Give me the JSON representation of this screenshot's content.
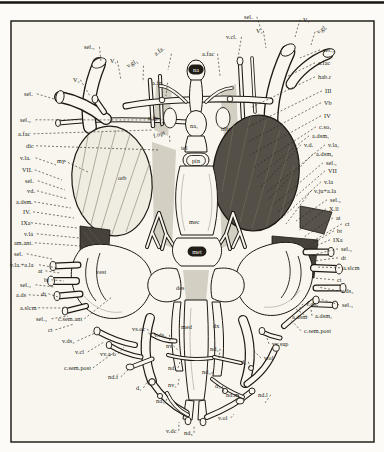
{
  "figure": {
    "kind": "anatomical-plate",
    "colors": {
      "ink": "#1d1812",
      "paper": "#f8f6ef",
      "orbit_dark": "#544f47",
      "block_dark": "#46413a"
    },
    "labels": [
      {
        "t": "sel.₁",
        "x": 84,
        "y": 49,
        "lx": 101,
        "ly": 62
      },
      {
        "t": "V₂",
        "x": 73,
        "y": 82,
        "lx": 90,
        "ly": 96
      },
      {
        "t": "sel.",
        "x": 24,
        "y": 96,
        "lx": 54,
        "ly": 99
      },
      {
        "t": "sel.₂",
        "x": 20,
        "y": 122,
        "lx": 164,
        "ly": 120
      },
      {
        "t": "a.fac",
        "x": 18,
        "y": 136,
        "lx": 152,
        "ly": 130
      },
      {
        "t": "dic",
        "x": 26,
        "y": 148,
        "lx": 158,
        "ly": 150
      },
      {
        "t": "v.la.",
        "x": 20,
        "y": 160,
        "lx": 56,
        "ly": 165
      },
      {
        "t": "my",
        "x": 57,
        "y": 163,
        "lx": 88,
        "ly": 172
      },
      {
        "t": "VII.",
        "x": 22,
        "y": 172,
        "lx": 62,
        "ly": 180
      },
      {
        "t": "sel.",
        "x": 25,
        "y": 183,
        "lx": 65,
        "ly": 190
      },
      {
        "t": "vd.",
        "x": 27,
        "y": 193,
        "lx": 68,
        "ly": 199
      },
      {
        "t": "a.dsm.",
        "x": 16,
        "y": 204,
        "lx": 71,
        "ly": 208
      },
      {
        "t": "IV.",
        "x": 23,
        "y": 214,
        "lx": 74,
        "ly": 218
      },
      {
        "t": "IXa",
        "x": 21,
        "y": 225,
        "lx": 77,
        "ly": 228
      },
      {
        "t": "v.la",
        "x": 24,
        "y": 236,
        "lx": 79,
        "ly": 238
      },
      {
        "t": "am.ant.",
        "x": 14,
        "y": 245,
        "lx": 81,
        "ly": 246
      },
      {
        "t": "sel.",
        "x": 14,
        "y": 256,
        "lx": 52,
        "ly": 259
      },
      {
        "t": "v.la.+a.la",
        "x": 10,
        "y": 267,
        "lx": 58,
        "ly": 268
      },
      {
        "t": "at",
        "x": 38,
        "y": 273,
        "lx": 60,
        "ly": 273
      },
      {
        "t": "bt",
        "x": 44,
        "y": 282,
        "lx": 64,
        "ly": 281
      },
      {
        "t": "sel.₃",
        "x": 20,
        "y": 287,
        "lx": 54,
        "ly": 287
      },
      {
        "t": "a.ds",
        "x": 16,
        "y": 297,
        "lx": 48,
        "ly": 296
      },
      {
        "t": "dt",
        "x": 41,
        "y": 296,
        "lx": 58,
        "ly": 297
      },
      {
        "t": "a.slcm",
        "x": 20,
        "y": 310,
        "lx": 64,
        "ly": 308
      },
      {
        "t": "sel.₄",
        "x": 36,
        "y": 321,
        "lx": 68,
        "ly": 316
      },
      {
        "t": "c.sem.ant",
        "x": 58,
        "y": 321,
        "lx": 112,
        "ly": 297
      },
      {
        "t": "ct",
        "x": 48,
        "y": 332,
        "lx": 74,
        "ly": 324
      },
      {
        "t": "v.ds₄",
        "x": 62,
        "y": 343,
        "lx": 95,
        "ly": 333
      },
      {
        "t": "v.cl",
        "x": 75,
        "y": 354,
        "lx": 104,
        "ly": 342
      },
      {
        "t": "c.sem.post",
        "x": 64,
        "y": 370,
        "lx": 116,
        "ly": 351
      },
      {
        "t": "vv.a-o",
        "x": 100,
        "y": 356,
        "lx": 124,
        "ly": 347
      },
      {
        "t": "nd.f",
        "x": 108,
        "y": 379,
        "lx": 128,
        "ly": 370
      },
      {
        "t": "d₁",
        "x": 136,
        "y": 390,
        "lx": 148,
        "ly": 381
      },
      {
        "t": "nd₄",
        "x": 156,
        "y": 403,
        "lx": 168,
        "ly": 395
      },
      {
        "t": "v.dc",
        "x": 166,
        "y": 433,
        "lx": 179,
        "ly": 422
      },
      {
        "t": "nd₅",
        "x": 184,
        "y": 435,
        "lx": 194,
        "ly": 425
      },
      {
        "t": "nv₁",
        "x": 168,
        "y": 387,
        "lx": 179,
        "ly": 379
      },
      {
        "t": "nd₁",
        "x": 168,
        "y": 370,
        "lx": 180,
        "ly": 362
      },
      {
        "t": "nv",
        "x": 166,
        "y": 348,
        "lx": 179,
        "ly": 351
      },
      {
        "t": "v.ds₅",
        "x": 154,
        "y": 337,
        "lx": 170,
        "ly": 342
      },
      {
        "t": "vs.oc",
        "x": 132,
        "y": 331,
        "lx": 150,
        "ly": 336
      },
      {
        "t": "med",
        "x": 181,
        "y": 329
      },
      {
        "t": "dx",
        "x": 213,
        "y": 328
      },
      {
        "t": "nd₂",
        "x": 210,
        "y": 351,
        "lx": 219,
        "ly": 358
      },
      {
        "t": "nd₃",
        "x": 202,
        "y": 374,
        "lx": 212,
        "ly": 381
      },
      {
        "t": "d₄",
        "x": 215,
        "y": 388,
        "lx": 224,
        "ly": 393
      },
      {
        "t": "nd.m",
        "x": 226,
        "y": 397,
        "lx": 237,
        "ly": 401
      },
      {
        "t": "nd.l",
        "x": 258,
        "y": 397,
        "lx": 265,
        "ly": 403
      },
      {
        "t": "v.ol",
        "x": 218,
        "y": 420,
        "lx": 234,
        "ly": 414
      },
      {
        "t": "d₂",
        "x": 241,
        "y": 364,
        "lx": 250,
        "ly": 369
      },
      {
        "t": "sel.",
        "x": 244,
        "y": 19,
        "lx": 262,
        "ly": 32
      },
      {
        "t": "V₁",
        "x": 303,
        "y": 22,
        "lx": 295,
        "ly": 37
      },
      {
        "t": "v.gl.",
        "x": 318,
        "y": 34,
        "rot": -32,
        "lx": 311,
        "ly": 45
      },
      {
        "t": "sel.₄",
        "x": 323,
        "y": 52,
        "lx": 300,
        "ly": 58
      },
      {
        "t": "a.fac",
        "x": 318,
        "y": 65,
        "lx": 286,
        "ly": 77
      },
      {
        "t": "hab.r",
        "x": 318,
        "y": 79,
        "lx": 250,
        "ly": 108
      },
      {
        "t": "III",
        "x": 325,
        "y": 93,
        "lx": 246,
        "ly": 128
      },
      {
        "t": "Vb",
        "x": 324,
        "y": 105,
        "lx": 248,
        "ly": 142
      },
      {
        "t": "IV",
        "x": 324,
        "y": 118,
        "lx": 250,
        "ly": 155
      },
      {
        "t": "c.so₁",
        "x": 319,
        "y": 129,
        "lx": 253,
        "ly": 168
      },
      {
        "t": "a.dsm₁",
        "x": 312,
        "y": 138,
        "lx": 256,
        "ly": 178
      },
      {
        "t": "v.d.",
        "x": 304,
        "y": 147,
        "lx": 260,
        "ly": 188
      },
      {
        "t": "v.la₁",
        "x": 328,
        "y": 147,
        "lx": 266,
        "ly": 193
      },
      {
        "t": "a.dsm₂",
        "x": 316,
        "y": 156,
        "lx": 268,
        "ly": 200
      },
      {
        "t": "sel.₁",
        "x": 326,
        "y": 165,
        "lx": 272,
        "ly": 206
      },
      {
        "t": "VII",
        "x": 328,
        "y": 173,
        "lx": 278,
        "ly": 212
      },
      {
        "t": "v.la",
        "x": 324,
        "y": 184,
        "lx": 282,
        "ly": 218
      },
      {
        "t": "v.ju+a.la",
        "x": 314,
        "y": 193,
        "lx": 286,
        "ly": 224
      },
      {
        "t": "sel.₂",
        "x": 330,
        "y": 202,
        "lx": 296,
        "ly": 221
      },
      {
        "t": "X.ll",
        "x": 329,
        "y": 211,
        "lx": 298,
        "ly": 231
      },
      {
        "t": "at",
        "x": 336,
        "y": 220,
        "lx": 304,
        "ly": 237
      },
      {
        "t": "ct",
        "x": 345,
        "y": 226,
        "lx": 313,
        "ly": 241
      },
      {
        "t": "bt",
        "x": 337,
        "y": 233,
        "lx": 308,
        "ly": 246
      },
      {
        "t": "IXa",
        "x": 333,
        "y": 242,
        "lx": 304,
        "ly": 251
      },
      {
        "t": "sel.₃",
        "x": 341,
        "y": 251,
        "lx": 312,
        "ly": 255
      },
      {
        "t": "dt",
        "x": 341,
        "y": 260,
        "lx": 314,
        "ly": 261
      },
      {
        "t": "a.slcm",
        "x": 343,
        "y": 270,
        "lx": 316,
        "ly": 267
      },
      {
        "t": "ct",
        "x": 337,
        "y": 282,
        "lx": 314,
        "ly": 278
      },
      {
        "t": "v.ds₃",
        "x": 341,
        "y": 293,
        "lx": 318,
        "ly": 287
      },
      {
        "t": "v.ds₅",
        "x": 306,
        "y": 306,
        "lx": 296,
        "ly": 313
      },
      {
        "t": "sel.₄",
        "x": 342,
        "y": 307,
        "lx": 320,
        "ly": 299
      },
      {
        "t": "a.dsm",
        "x": 292,
        "y": 319,
        "lx": 296,
        "ly": 309
      },
      {
        "t": "a.dsm₁",
        "x": 315,
        "y": 318,
        "lx": 311,
        "ly": 309
      },
      {
        "t": "c.sem.post",
        "x": 304,
        "y": 333,
        "lx": 290,
        "ly": 319
      },
      {
        "t": "vv.sup",
        "x": 272,
        "y": 346,
        "lx": 266,
        "ly": 335
      },
      {
        "t": "v.ol",
        "x": 264,
        "y": 360,
        "lx": 254,
        "ly": 351
      },
      {
        "t": "V₁",
        "x": 110,
        "y": 63,
        "lx": 121,
        "ly": 80
      },
      {
        "t": "v.gl₁",
        "x": 128,
        "y": 68,
        "rot": -30,
        "lx": 143,
        "ly": 82
      },
      {
        "t": "a.fa.",
        "x": 156,
        "y": 56,
        "rot": -38,
        "lx": 168,
        "ly": 70
      },
      {
        "t": "a.fn.",
        "x": 152,
        "y": 85,
        "lx": 166,
        "ly": 96
      },
      {
        "t": "a.fp.",
        "x": 148,
        "y": 120,
        "lx": 161,
        "ly": 127
      },
      {
        "t": "f.opt",
        "x": 154,
        "y": 138,
        "rot": -18,
        "lx": 170,
        "ly": 143
      },
      {
        "t": "a.fac",
        "x": 202,
        "y": 56,
        "lx": 220,
        "ly": 76
      },
      {
        "t": "v.cl.",
        "x": 226,
        "y": 39,
        "lx": 238,
        "ly": 58
      },
      {
        "t": "V₂",
        "x": 256,
        "y": 33,
        "lx": 266,
        "ly": 48
      },
      {
        "t": "olfc",
        "x": 221,
        "y": 131
      },
      {
        "t": "na",
        "x": 196,
        "y": 72,
        "box": "dark"
      },
      {
        "t": "na₁",
        "x": 190,
        "y": 128
      },
      {
        "t": "tel",
        "x": 181,
        "y": 150
      },
      {
        "t": "pin",
        "x": 196,
        "y": 163,
        "box": "cap"
      },
      {
        "t": "orb",
        "x": 118,
        "y": 180
      },
      {
        "t": "mec",
        "x": 189,
        "y": 224
      },
      {
        "t": "met",
        "x": 197,
        "y": 254,
        "box": "dark"
      },
      {
        "t": "vest",
        "x": 96,
        "y": 274
      },
      {
        "t": "vest",
        "x": 282,
        "y": 251,
        "light": true,
        "mid": true
      },
      {
        "t": "v.cl",
        "x": 262,
        "y": 265,
        "light": true
      },
      {
        "t": "des",
        "x": 176,
        "y": 290
      }
    ]
  }
}
